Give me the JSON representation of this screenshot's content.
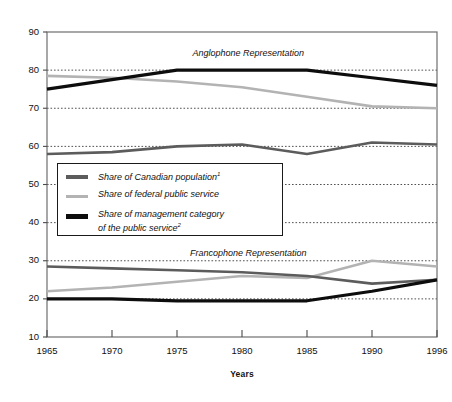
{
  "chart_data": {
    "type": "line",
    "title": "",
    "xlabel": "Years",
    "ylabel": "",
    "x": [
      1965,
      1970,
      1975,
      1980,
      1985,
      1990,
      1996
    ],
    "xtick_labels": [
      "1965",
      "1970",
      "1975",
      "1980",
      "1985",
      "1990",
      "1996"
    ],
    "ytick_labels": [
      "90",
      "80",
      "70",
      "60",
      "50",
      "40",
      "30",
      "20",
      "10"
    ],
    "ylim": [
      10,
      90
    ],
    "ytick_step": 10,
    "grid": "horizontal-dotted",
    "legend_position": "inside-left-middle",
    "annotations": [
      {
        "text": "Anglophone Representation",
        "x": 1981,
        "y": 84
      },
      {
        "text": "Francophone Representation",
        "x": 1981,
        "y": 31.5
      }
    ],
    "groups": [
      {
        "name": "Anglophone Representation",
        "series": [
          {
            "name": "Share of management category of the public service",
            "color": "#0d0d0d",
            "width": 3.2,
            "values": [
              75.0,
              77.5,
              80.0,
              80.0,
              80.0,
              78.0,
              76.0
            ]
          },
          {
            "name": "Share of federal public service",
            "color": "#b3b3b3",
            "width": 2.6,
            "values": [
              78.5,
              78.0,
              77.0,
              75.5,
              73.0,
              70.5,
              70.0
            ]
          },
          {
            "name": "Share of Canadian population",
            "color": "#5c5c5c",
            "width": 2.6,
            "values": [
              58.0,
              58.5,
              60.0,
              60.5,
              58.0,
              61.0,
              60.5
            ]
          }
        ]
      },
      {
        "name": "Francophone Representation",
        "series": [
          {
            "name": "Share of Canadian population",
            "color": "#5c5c5c",
            "width": 2.6,
            "values": [
              28.5,
              28.0,
              27.5,
              27.0,
              26.0,
              24.0,
              25.0
            ]
          },
          {
            "name": "Share of federal public service",
            "color": "#b3b3b3",
            "width": 2.6,
            "values": [
              22.0,
              23.0,
              24.5,
              26.0,
              25.5,
              30.0,
              28.5
            ]
          },
          {
            "name": "Share of management category of the public service",
            "color": "#0d0d0d",
            "width": 3.2,
            "values": [
              20.0,
              20.0,
              19.5,
              19.5,
              19.5,
              22.0,
              25.0
            ]
          }
        ]
      }
    ],
    "legend": [
      {
        "label": "Share of Canadian population",
        "superscript": "1",
        "color": "#5c5c5c",
        "swatch": "line-swatch-canadian-population"
      },
      {
        "label": "Share of federal public service",
        "superscript": "",
        "color": "#b3b3b3",
        "swatch": "line-swatch-federal-public-service"
      },
      {
        "label": "Share of management category of the public service",
        "label_line1": "Share of management category",
        "label_line2": "of the public service",
        "superscript": "2",
        "color": "#0d0d0d",
        "swatch": "line-swatch-management-category"
      }
    ]
  },
  "axis": {
    "x_title": "Years"
  }
}
